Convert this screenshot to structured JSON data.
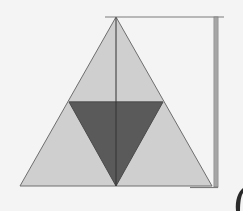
{
  "diagram": {
    "title": "Sierpinski-style subdivided triangle with height marker",
    "colors": {
      "background": "#f4f4f4",
      "outer_fill": "#cfcfcf",
      "inner_fill": "#5a5a5a",
      "stroke": "#6e6e6e",
      "center_line": "#333333",
      "marker_bar": "#9a9a9a",
      "marker_edge": "#7a7a7a",
      "corner_mark": "#2a2a2a"
    },
    "shapes": {
      "outer_triangle": [
        [
          116,
          17
        ],
        [
          20,
          186
        ],
        [
          212,
          186
        ]
      ],
      "inner_triangle": [
        [
          69,
          102
        ],
        [
          163,
          102
        ],
        [
          116,
          186
        ]
      ],
      "midline": [
        [
          69,
          102
        ],
        [
          163,
          102
        ]
      ],
      "center_line": [
        [
          116,
          17
        ],
        [
          116,
          186
        ]
      ],
      "top_line": [
        [
          105,
          17
        ],
        [
          224,
          17
        ]
      ],
      "height_bar": {
        "x": 214,
        "y1": 17,
        "y2": 187,
        "width": 4
      },
      "bottom_tick": [
        [
          190,
          187
        ],
        [
          218,
          187
        ]
      ]
    }
  }
}
